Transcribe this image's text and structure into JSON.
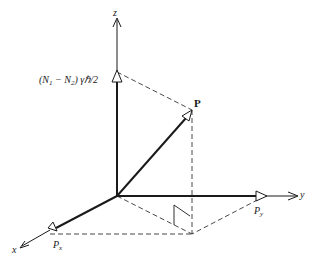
{
  "diagram": {
    "type": "3d-vector-diagram",
    "colors": {
      "ink": "#1a1a1a",
      "background": "#ffffff"
    },
    "axes": {
      "z": {
        "label": "z"
      },
      "y": {
        "label": "y"
      },
      "x": {
        "label": "x"
      }
    },
    "vector": {
      "label": "P"
    },
    "components": {
      "z_component": {
        "label_main": "(N",
        "label_sub1": "1",
        "label_mid": " − N",
        "label_sub2": "2",
        "label_end": ") γℏ/2"
      },
      "y_component": {
        "label_main": "P",
        "label_sub": "y"
      },
      "x_component": {
        "label_main": "P",
        "label_sub": "x"
      }
    },
    "annotations": [
      "right-angle marker between projection and floor plane"
    ]
  }
}
